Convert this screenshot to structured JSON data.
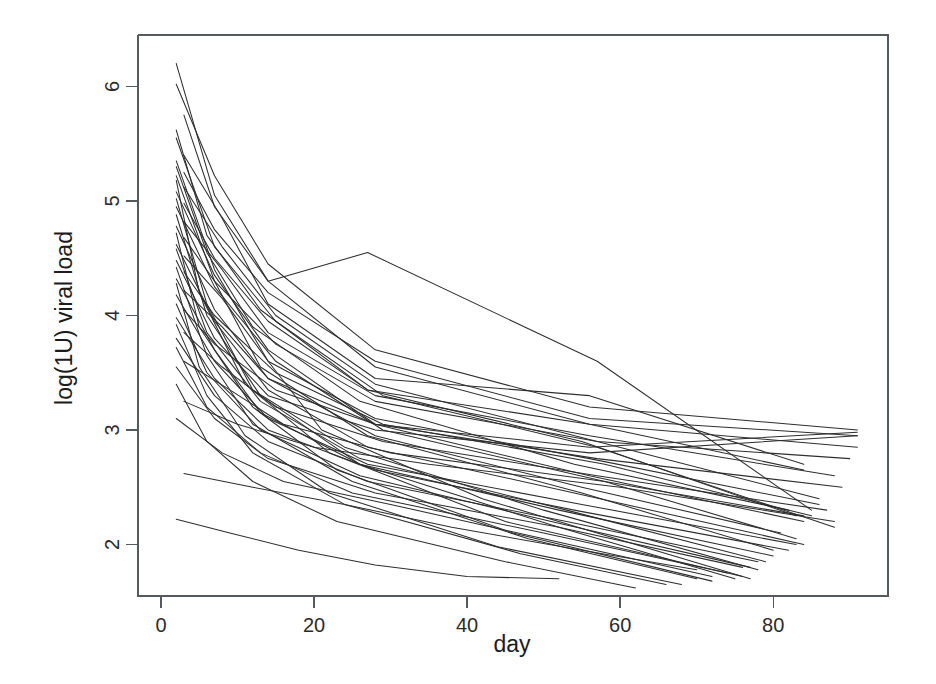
{
  "figure": {
    "background_color": "#ffffff",
    "line_color": "#2e2e2e",
    "axis_color": "#555a5e",
    "text_color": "#1c1c1c"
  },
  "chart_data": {
    "type": "line",
    "title": "",
    "subtitle": "",
    "xlabel": "day",
    "ylabel": "log(1U) viral load",
    "xlim": [
      -3,
      95
    ],
    "ylim": [
      1.55,
      6.45
    ],
    "xticks": [
      0,
      20,
      40,
      60,
      80
    ],
    "xtick_labels": [
      "0",
      "20",
      "40",
      "60",
      "80"
    ],
    "yticks": [
      2,
      3,
      4,
      5,
      6
    ],
    "ytick_labels": [
      "2",
      "3",
      "4",
      "5",
      "6"
    ],
    "grid": false,
    "legend": null,
    "legend_position": "none",
    "box_frame": true,
    "n_series": 45,
    "series_description": "Individual subject viral-load decay trajectories (spaghetti plot)",
    "series": [
      {
        "name": "subject-01",
        "x": [
          2,
          7,
          14,
          28,
          56,
          84
        ],
        "y": [
          6.2,
          5.05,
          4.3,
          3.55,
          3.05,
          2.65
        ]
      },
      {
        "name": "subject-02",
        "x": [
          2,
          7,
          14,
          28,
          56,
          91
        ],
        "y": [
          6.02,
          5.22,
          4.45,
          3.7,
          3.2,
          3.0
        ]
      },
      {
        "name": "subject-03",
        "x": [
          3,
          7,
          14,
          27,
          57,
          85
        ],
        "y": [
          5.75,
          4.95,
          4.3,
          4.55,
          3.6,
          2.3
        ]
      },
      {
        "name": "subject-04",
        "x": [
          2,
          6,
          13,
          27,
          55,
          83
        ],
        "y": [
          5.62,
          4.7,
          4.05,
          3.35,
          2.9,
          2.25
        ]
      },
      {
        "name": "subject-05",
        "x": [
          2,
          7,
          15,
          29,
          57,
          88
        ],
        "y": [
          5.55,
          4.6,
          3.95,
          3.3,
          2.85,
          2.15
        ]
      },
      {
        "name": "subject-06",
        "x": [
          3,
          8,
          14,
          28,
          56,
          84
        ],
        "y": [
          5.4,
          4.85,
          4.1,
          3.45,
          3.3,
          2.7
        ]
      },
      {
        "name": "subject-07",
        "x": [
          2,
          7,
          14,
          21,
          42,
          77
        ],
        "y": [
          5.35,
          4.4,
          3.6,
          3.0,
          2.4,
          1.7
        ]
      },
      {
        "name": "subject-08",
        "x": [
          2,
          6,
          12,
          26,
          54,
          82
        ],
        "y": [
          5.3,
          4.55,
          3.9,
          3.25,
          2.7,
          2.3
        ]
      },
      {
        "name": "subject-09",
        "x": [
          3,
          7,
          14,
          28,
          56,
          91
        ],
        "y": [
          5.25,
          4.75,
          4.2,
          3.6,
          3.1,
          2.95
        ]
      },
      {
        "name": "subject-10",
        "x": [
          2,
          7,
          13,
          27,
          55,
          80
        ],
        "y": [
          5.22,
          4.3,
          3.55,
          2.95,
          2.45,
          1.95
        ]
      },
      {
        "name": "subject-11",
        "x": [
          2,
          5,
          11,
          22,
          45,
          76
        ],
        "y": [
          5.18,
          4.2,
          3.4,
          2.8,
          2.2,
          1.72
        ]
      },
      {
        "name": "subject-12",
        "x": [
          3,
          8,
          15,
          28,
          57,
          86
        ],
        "y": [
          5.12,
          4.6,
          4.0,
          3.4,
          2.9,
          2.4
        ]
      },
      {
        "name": "subject-13",
        "x": [
          2,
          7,
          14,
          28,
          56,
          84
        ],
        "y": [
          5.08,
          4.35,
          3.7,
          3.05,
          2.6,
          2.2
        ]
      },
      {
        "name": "subject-14",
        "x": [
          2,
          6,
          12,
          24,
          50,
          78
        ],
        "y": [
          5.02,
          4.1,
          3.35,
          2.85,
          2.3,
          1.78
        ]
      },
      {
        "name": "subject-15",
        "x": [
          3,
          7,
          14,
          27,
          56,
          91
        ],
        "y": [
          4.98,
          4.5,
          3.95,
          3.35,
          3.05,
          2.85
        ]
      },
      {
        "name": "subject-16",
        "x": [
          2,
          7,
          15,
          29,
          58,
          83
        ],
        "y": [
          4.95,
          4.25,
          3.6,
          3.0,
          2.55,
          2.05
        ]
      },
      {
        "name": "subject-17",
        "x": [
          2,
          6,
          13,
          26,
          52,
          75
        ],
        "y": [
          4.88,
          4.0,
          3.3,
          2.7,
          2.15,
          1.7
        ]
      },
      {
        "name": "subject-18",
        "x": [
          3,
          8,
          14,
          28,
          56,
          88
        ],
        "y": [
          4.82,
          4.4,
          3.85,
          3.3,
          2.95,
          2.6
        ]
      },
      {
        "name": "subject-19",
        "x": [
          2,
          7,
          14,
          28,
          55,
          81
        ],
        "y": [
          4.78,
          4.05,
          3.45,
          2.95,
          2.5,
          2.1
        ]
      },
      {
        "name": "subject-20",
        "x": [
          2,
          5,
          12,
          23,
          46,
          72
        ],
        "y": [
          4.72,
          3.9,
          3.2,
          2.65,
          2.1,
          1.68
        ]
      },
      {
        "name": "subject-21",
        "x": [
          3,
          7,
          15,
          28,
          57,
          90
        ],
        "y": [
          4.68,
          4.3,
          3.75,
          3.25,
          2.9,
          2.75
        ]
      },
      {
        "name": "subject-22",
        "x": [
          2,
          7,
          14,
          27,
          54,
          84
        ],
        "y": [
          4.62,
          3.95,
          3.35,
          2.85,
          2.45,
          2.0
        ]
      },
      {
        "name": "subject-23",
        "x": [
          2,
          6,
          13,
          26,
          53,
          79
        ],
        "y": [
          4.58,
          3.85,
          3.25,
          2.75,
          2.3,
          1.85
        ]
      },
      {
        "name": "subject-24",
        "x": [
          3,
          8,
          14,
          28,
          56,
          86
        ],
        "y": [
          4.52,
          4.15,
          3.6,
          3.1,
          2.75,
          2.35
        ]
      },
      {
        "name": "subject-25",
        "x": [
          2,
          7,
          14,
          28,
          56,
          91
        ],
        "y": [
          4.48,
          3.8,
          3.3,
          3.0,
          2.8,
          2.95
        ]
      },
      {
        "name": "subject-26",
        "x": [
          2,
          6,
          12,
          25,
          48,
          70
        ],
        "y": [
          4.42,
          3.65,
          3.05,
          2.55,
          2.05,
          1.7
        ]
      },
      {
        "name": "subject-27",
        "x": [
          3,
          7,
          15,
          29,
          58,
          85
        ],
        "y": [
          4.38,
          4.0,
          3.5,
          3.05,
          2.7,
          2.25
        ]
      },
      {
        "name": "subject-28",
        "x": [
          2,
          7,
          13,
          26,
          52,
          80
        ],
        "y": [
          4.32,
          3.7,
          3.15,
          2.7,
          2.3,
          1.9
        ]
      },
      {
        "name": "subject-29",
        "x": [
          2,
          5,
          11,
          22,
          44,
          68
        ],
        "y": [
          4.28,
          3.55,
          2.95,
          2.45,
          1.98,
          1.65
        ]
      },
      {
        "name": "subject-30",
        "x": [
          3,
          8,
          14,
          28,
          57,
          89
        ],
        "y": [
          4.22,
          3.9,
          3.45,
          3.05,
          2.75,
          2.5
        ]
      },
      {
        "name": "subject-31",
        "x": [
          2,
          7,
          14,
          27,
          55,
          83
        ],
        "y": [
          4.18,
          3.6,
          3.1,
          2.7,
          2.35,
          2.0
        ]
      },
      {
        "name": "subject-32",
        "x": [
          2,
          6,
          13,
          26,
          51,
          77
        ],
        "y": [
          4.1,
          3.5,
          3.0,
          2.6,
          2.2,
          1.8
        ]
      },
      {
        "name": "subject-33",
        "x": [
          3,
          7,
          15,
          28,
          56,
          91
        ],
        "y": [
          4.05,
          3.75,
          3.35,
          3.05,
          2.85,
          2.98
        ]
      },
      {
        "name": "subject-34",
        "x": [
          2,
          7,
          14,
          28,
          54,
          82
        ],
        "y": [
          3.98,
          3.45,
          3.0,
          2.65,
          2.3,
          1.95
        ]
      },
      {
        "name": "subject-35",
        "x": [
          2,
          6,
          12,
          24,
          47,
          66
        ],
        "y": [
          3.92,
          3.3,
          2.8,
          2.35,
          1.92,
          1.65
        ]
      },
      {
        "name": "subject-36",
        "x": [
          3,
          8,
          15,
          29,
          57,
          87
        ],
        "y": [
          3.85,
          3.55,
          3.2,
          2.9,
          2.6,
          2.3
        ]
      },
      {
        "name": "subject-37",
        "x": [
          2,
          7,
          14,
          27,
          53,
          78
        ],
        "y": [
          3.8,
          3.3,
          2.9,
          2.55,
          2.2,
          1.85
        ]
      },
      {
        "name": "subject-38",
        "x": [
          2,
          6,
          13,
          25,
          50,
          74
        ],
        "y": [
          3.72,
          3.2,
          2.8,
          2.45,
          2.1,
          1.75
        ]
      },
      {
        "name": "subject-39",
        "x": [
          3,
          9,
          16,
          30,
          58,
          84
        ],
        "y": [
          3.6,
          3.35,
          3.05,
          2.8,
          2.55,
          2.25
        ]
      },
      {
        "name": "subject-40",
        "x": [
          2,
          7,
          14,
          28,
          52,
          76
        ],
        "y": [
          3.55,
          3.1,
          2.75,
          2.45,
          2.15,
          1.8
        ]
      },
      {
        "name": "subject-41",
        "x": [
          2,
          6,
          12,
          23,
          45,
          62
        ],
        "y": [
          3.4,
          2.9,
          2.55,
          2.2,
          1.85,
          1.62
        ]
      },
      {
        "name": "subject-42",
        "x": [
          3,
          10,
          20,
          35,
          60,
          88
        ],
        "y": [
          3.25,
          3.05,
          2.85,
          2.7,
          2.5,
          2.2
        ]
      },
      {
        "name": "subject-43",
        "x": [
          2,
          8,
          16,
          30,
          50,
          72
        ],
        "y": [
          3.1,
          2.8,
          2.55,
          2.35,
          2.05,
          1.72
        ]
      },
      {
        "name": "subject-44",
        "x": [
          2,
          9,
          18,
          28,
          40,
          52
        ],
        "y": [
          2.22,
          2.1,
          1.95,
          1.82,
          1.72,
          1.7
        ]
      },
      {
        "name": "subject-45",
        "x": [
          3,
          12,
          24,
          38,
          55,
          70
        ],
        "y": [
          2.62,
          2.5,
          2.35,
          2.15,
          1.95,
          1.78
        ]
      }
    ]
  }
}
